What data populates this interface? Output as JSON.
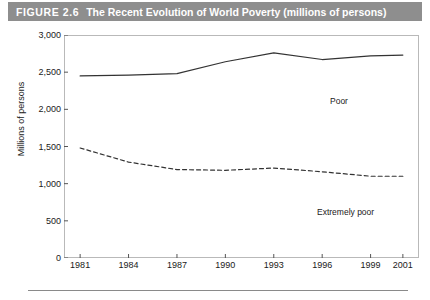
{
  "header": {
    "figure_number": "FIGURE 2.6",
    "title": "The Recent Evolution of World Poverty (millions of persons)",
    "bar_color": "#8e8e8e",
    "text_color": "#ffffff"
  },
  "chart_data": {
    "type": "line",
    "title": "The Recent Evolution of World Poverty (millions of persons)",
    "xlabel": "",
    "ylabel": "Millions of persons",
    "x": [
      1981,
      1984,
      1987,
      1990,
      1993,
      1996,
      1999,
      2001
    ],
    "xlim": [
      1980,
      2002
    ],
    "ylim": [
      0,
      3000
    ],
    "ytick_labels": [
      "0",
      "500",
      "1,000",
      "1,500",
      "2,000",
      "2,500",
      "3,000"
    ],
    "ytick_values": [
      0,
      500,
      1000,
      1500,
      2000,
      2500,
      3000
    ],
    "xtick_labels": [
      "1981",
      "1984",
      "1987",
      "1990",
      "1993",
      "1996",
      "1999",
      "2001"
    ],
    "grid": false,
    "legend": "inline-labels",
    "series": [
      {
        "name": "Poor",
        "style": "solid",
        "color": "#333333",
        "label_position": "inline-right",
        "values": [
          2450,
          2460,
          2480,
          2640,
          2760,
          2670,
          2720,
          2730
        ]
      },
      {
        "name": "Extremely poor",
        "style": "dashed",
        "color": "#333333",
        "label_position": "inline-right-below",
        "values": [
          1480,
          1290,
          1190,
          1180,
          1210,
          1160,
          1100,
          1100
        ]
      }
    ]
  }
}
